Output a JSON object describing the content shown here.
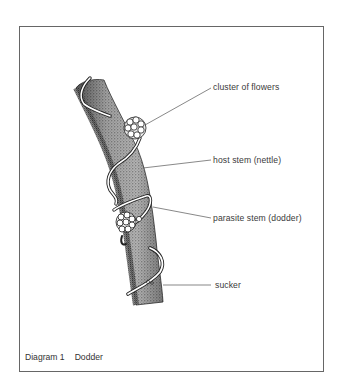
{
  "diagram": {
    "title": "Diagram 1",
    "subject": "Dodder",
    "labels": [
      {
        "id": "cluster-of-flowers",
        "text": "cluster of flowers"
      },
      {
        "id": "host-stem",
        "text": "host stem (nettle)"
      },
      {
        "id": "parasite-stem",
        "text": "parasite stem (dodder)"
      },
      {
        "id": "sucker",
        "text": "sucker"
      }
    ]
  },
  "colors": {
    "frame": "#666666",
    "ink": "#222222",
    "stipple": "#555555",
    "background": "#ffffff"
  }
}
